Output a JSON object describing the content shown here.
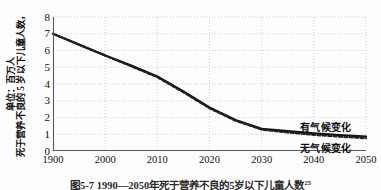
{
  "chart_data": {
    "type": "line",
    "title": "图5-7  1990—2050年死于营养不良的5岁以下儿童人数",
    "title_note": "25",
    "xlabel": "",
    "ylabel_line1": "死于营养不良的 5 岁以下儿童人数，",
    "ylabel_line2": "单位：百万人",
    "xlim": [
      1990,
      2050
    ],
    "ylim": [
      0,
      8
    ],
    "grid": true,
    "grid_style": "dotted",
    "legend_position": "inline-right",
    "xticks": [
      "1900",
      "2000",
      "2010",
      "2020",
      "2030",
      "2040",
      "2050"
    ],
    "xtick_values": [
      1990,
      2000,
      2010,
      2020,
      2030,
      2040,
      2050
    ],
    "yticks": [
      "0",
      "1",
      "2",
      "3",
      "4",
      "5",
      "6",
      "7",
      "8"
    ],
    "ytick_values": [
      0,
      1,
      2,
      3,
      4,
      5,
      6,
      7,
      8
    ],
    "x": [
      1990,
      1995,
      2000,
      2005,
      2010,
      2015,
      2020,
      2025,
      2030,
      2035,
      2040,
      2045,
      2050
    ],
    "series": [
      {
        "name": "有气候变化",
        "style": "solid",
        "color": "#111111",
        "values": [
          7.0,
          6.35,
          5.7,
          5.1,
          4.45,
          3.55,
          2.6,
          1.85,
          1.32,
          1.18,
          1.05,
          0.95,
          0.86
        ]
      },
      {
        "name": "无气候变化",
        "style": "dashed",
        "color": "#222222",
        "values": [
          7.0,
          6.35,
          5.7,
          5.05,
          4.4,
          3.5,
          2.55,
          1.8,
          1.27,
          1.1,
          0.96,
          0.85,
          0.76
        ]
      }
    ],
    "annotations": [
      {
        "id": "with-climate-change",
        "text": "有气候变化"
      },
      {
        "id": "no-climate-change",
        "text": "无气候变化"
      }
    ]
  },
  "colors": {
    "axis": "#5a5a5a",
    "grid": "#b9c3d2",
    "solid_series": "#111111",
    "dashed_series": "#222222",
    "text": "#111111"
  }
}
